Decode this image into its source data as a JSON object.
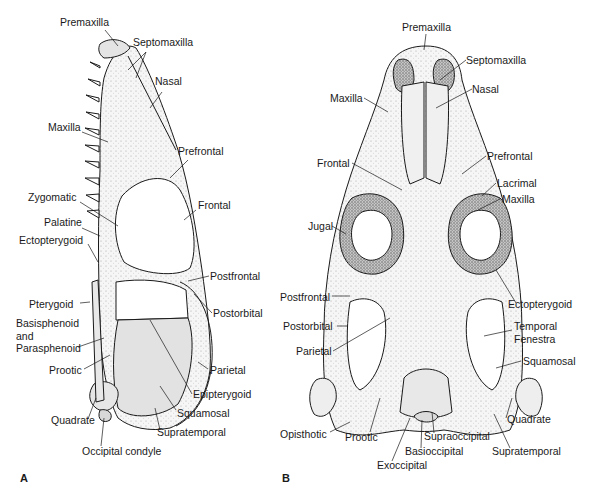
{
  "figure": {
    "panels": [
      {
        "id": "A",
        "letter": "A",
        "view": "lateral",
        "labels": [
          {
            "text": "Premaxilla",
            "x": 60,
            "y": 22
          },
          {
            "text": "Septomaxilla",
            "x": 133,
            "y": 42
          },
          {
            "text": "Nasal",
            "x": 155,
            "y": 81
          },
          {
            "text": "Maxilla",
            "x": 48,
            "y": 127
          },
          {
            "text": "Prefrontal",
            "x": 178,
            "y": 151
          },
          {
            "text": "Zygomatic",
            "x": 28,
            "y": 197
          },
          {
            "text": "Frontal",
            "x": 198,
            "y": 205
          },
          {
            "text": "Palatine",
            "x": 44,
            "y": 222
          },
          {
            "text": "Ectopterygoid",
            "x": 19,
            "y": 240
          },
          {
            "text": "Postfrontal",
            "x": 210,
            "y": 271
          },
          {
            "text": "Pterygoid",
            "x": 29,
            "y": 299
          },
          {
            "text": "Postorbital",
            "x": 213,
            "y": 308
          },
          {
            "text": "Basisphenoid",
            "x": 16,
            "y": 318
          },
          {
            "text": "and",
            "x": 16,
            "y": 331
          },
          {
            "text": "Parasphenoid",
            "x": 16,
            "y": 343
          },
          {
            "text": "Prootic",
            "x": 49,
            "y": 365
          },
          {
            "text": "Parietal",
            "x": 210,
            "y": 365
          },
          {
            "text": "Epipterygoid",
            "x": 193,
            "y": 389
          },
          {
            "text": "Quadrate",
            "x": 51,
            "y": 415
          },
          {
            "text": "Squamosal",
            "x": 177,
            "y": 408
          },
          {
            "text": "Supratemporal",
            "x": 157,
            "y": 427
          },
          {
            "text": "Occipital condyle",
            "x": 82,
            "y": 446
          }
        ]
      },
      {
        "id": "B",
        "letter": "B",
        "view": "dorsal",
        "labels": [
          {
            "text": "Premaxilla",
            "x": 402,
            "y": 22
          },
          {
            "text": "Septomaxilla",
            "x": 466,
            "y": 55
          },
          {
            "text": "Nasal",
            "x": 472,
            "y": 84
          },
          {
            "text": "Maxilla",
            "x": 330,
            "y": 93
          },
          {
            "text": "Frontal",
            "x": 317,
            "y": 158
          },
          {
            "text": "Prefrontal",
            "x": 487,
            "y": 151
          },
          {
            "text": "Lacrimal",
            "x": 497,
            "y": 178
          },
          {
            "text": "Maxilla",
            "x": 502,
            "y": 194
          },
          {
            "text": "Jugal",
            "x": 308,
            "y": 221
          },
          {
            "text": "Ectopterygoid",
            "x": 508,
            "y": 299
          },
          {
            "text": "Postfrontal",
            "x": 280,
            "y": 292
          },
          {
            "text": "Postorbital",
            "x": 283,
            "y": 321
          },
          {
            "text": "Temporal",
            "x": 514,
            "y": 321
          },
          {
            "text": "Fenestra",
            "x": 514,
            "y": 334
          },
          {
            "text": "Parietal",
            "x": 296,
            "y": 346
          },
          {
            "text": "Squamosal",
            "x": 523,
            "y": 356
          },
          {
            "text": "Quadrate",
            "x": 507,
            "y": 414
          },
          {
            "text": "Opisthotic",
            "x": 280,
            "y": 429
          },
          {
            "text": "Prootic",
            "x": 345,
            "y": 432
          },
          {
            "text": "Supraoccipital",
            "x": 424,
            "y": 431
          },
          {
            "text": "Basioccipital",
            "x": 405,
            "y": 446
          },
          {
            "text": "Supratemporal",
            "x": 492,
            "y": 446
          },
          {
            "text": "Exoccipital",
            "x": 377,
            "y": 460
          }
        ]
      }
    ],
    "colors": {
      "ink": "#1a1a1a",
      "bone_fill": "#f4f4f4",
      "shade_dark": "#8a8a8a",
      "shade_mid": "#bdbdbd",
      "background": "#ffffff"
    }
  }
}
